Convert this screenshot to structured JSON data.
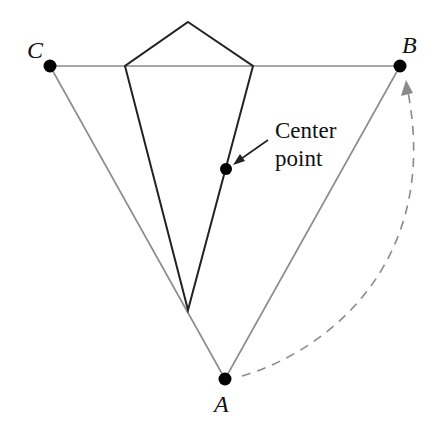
{
  "diagram": {
    "points": {
      "A": {
        "label": "A",
        "x": 225,
        "y": 379
      },
      "B": {
        "label": "B",
        "x": 400,
        "y": 66
      },
      "C": {
        "label": "C",
        "x": 50,
        "y": 66
      }
    },
    "center": {
      "label_line1": "Center",
      "label_line2": "point",
      "x": 226,
      "y": 169
    },
    "kite": {
      "top": [
        188,
        22
      ],
      "left": [
        125,
        66
      ],
      "right": [
        253,
        66
      ],
      "bottom": [
        188,
        310
      ]
    },
    "colors": {
      "triangle": "#8a8a8a",
      "kite": "#222222",
      "dots": "#000000",
      "dashed_arc": "#8a8a8a"
    }
  }
}
